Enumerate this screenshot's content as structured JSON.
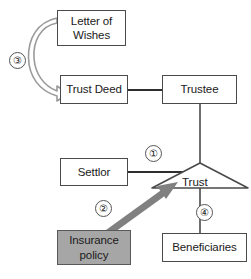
{
  "diagram": {
    "background_color": "#ffffff",
    "line_color": "#4a4a4a",
    "shaded_fill_color": "#a6a6a6",
    "arrow_gray_color": "#808080",
    "nodes": [
      {
        "id": "letter-of-wishes",
        "label": "Letter of\nWishes",
        "shape": "rectangle",
        "fill": "#ffffff"
      },
      {
        "id": "trust-deed",
        "label": "Trust Deed",
        "shape": "rectangle",
        "fill": "#ffffff"
      },
      {
        "id": "trustee",
        "label": "Trustee",
        "shape": "rectangle",
        "fill": "#ffffff"
      },
      {
        "id": "settlor",
        "label": "Settlor",
        "shape": "rectangle",
        "fill": "#ffffff"
      },
      {
        "id": "trust",
        "label": "Trust",
        "shape": "triangle",
        "fill": "#ffffff"
      },
      {
        "id": "insurance-policy",
        "label": "Insurance\npolicy",
        "shape": "rectangle",
        "fill": "#a6a6a6"
      },
      {
        "id": "beneficiaries",
        "label": "Beneficiaries",
        "shape": "rectangle",
        "fill": "#ffffff"
      }
    ],
    "markers": [
      {
        "id": "marker-1",
        "label": "①",
        "relates_to": "settlor-to-trust"
      },
      {
        "id": "marker-2",
        "label": "②",
        "relates_to": "insurance-policy-to-trust"
      },
      {
        "id": "marker-3",
        "label": "③",
        "relates_to": "letter-of-wishes-to-trust-deed"
      },
      {
        "id": "marker-4",
        "label": "④",
        "relates_to": "trust-to-beneficiaries"
      }
    ],
    "connectors": [
      {
        "id": "trust-deed-to-trustee",
        "style": "solid-line",
        "from": "trust-deed",
        "to": "trustee"
      },
      {
        "id": "trustee-to-trust",
        "style": "solid-line",
        "from": "trustee",
        "to": "trust"
      },
      {
        "id": "settlor-to-trust",
        "style": "solid-line",
        "from": "settlor",
        "to": "trust"
      },
      {
        "id": "trust-to-beneficiaries",
        "style": "solid-line",
        "from": "trust",
        "to": "beneficiaries"
      },
      {
        "id": "insurance-policy-to-trust",
        "style": "thick-gray-arrow",
        "from": "insurance-policy",
        "to": "trust"
      },
      {
        "id": "letter-of-wishes-to-trust-deed",
        "style": "curved-block-arrow",
        "from": "letter-of-wishes",
        "to": "trust-deed"
      }
    ]
  }
}
